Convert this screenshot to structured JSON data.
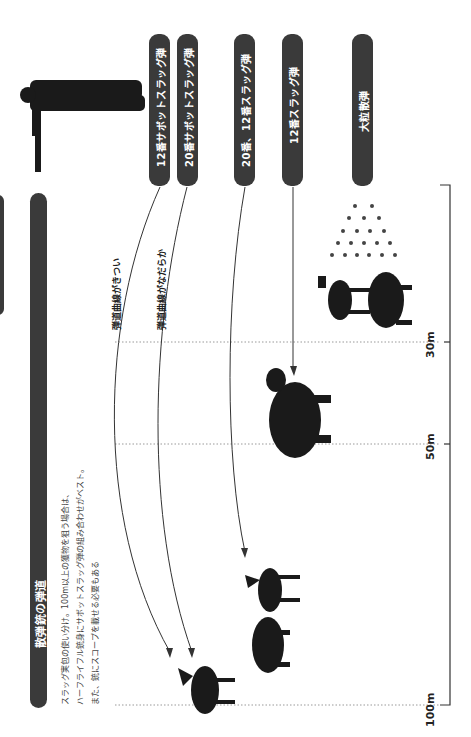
{
  "title": "散弾銃の弾道",
  "description": [
    "スラッグ実包の使い分け。100m以上の獲物を狙う場合は、",
    "ハーフライフル銃身にサボットスラッグ弾の組み合わせがベスト。",
    "また、銃にスコープを載せる必要もある"
  ],
  "ammo_labels": [
    {
      "id": "12-sabot",
      "label": "12番サボットスラッグ弾"
    },
    {
      "id": "20-sabot",
      "label": "20番サボットスラッグ弾"
    },
    {
      "id": "20-12-slug",
      "label": "20番、12番スラッグ弾"
    },
    {
      "id": "12-slug",
      "label": "12番スラッグ弾"
    },
    {
      "id": "buckshot",
      "label": "大粒散弾"
    }
  ],
  "annotations": {
    "steep": "弾道曲線がきつい",
    "gentle": "弾道曲線がなだらか"
  },
  "distances": [
    {
      "label": "30m"
    },
    {
      "label": "50m"
    },
    {
      "label": "100m"
    }
  ],
  "colors": {
    "pill": "#3a3a3a",
    "line": "#333333",
    "text": "#222222"
  }
}
